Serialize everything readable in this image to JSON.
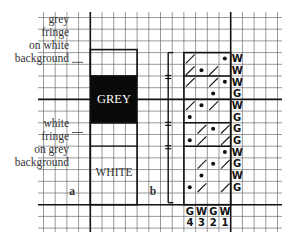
{
  "panel_a": {
    "letter": "a",
    "fringe_label_top": [
      "grey",
      "fringe",
      "on white",
      "background"
    ],
    "fringe_label_bottom": [
      "white",
      "fringe",
      "on grey",
      "background"
    ],
    "grey_block_label": "GREY",
    "white_block_label": "WHITE",
    "colors": {
      "grey_block": "#0a0a0a",
      "grey_text": "#ffffff",
      "white_text": "#333333"
    }
  },
  "panel_b": {
    "letter": "b",
    "row_colors": [
      "W",
      "W",
      "W",
      "G",
      "W",
      "G",
      "G",
      "G",
      "W",
      "G",
      "W",
      "G"
    ],
    "rows": [
      {
        "slashes": [
          1
        ],
        "dots": [
          4
        ]
      },
      {
        "slashes": [
          1,
          3
        ],
        "dots": [
          2
        ]
      },
      {
        "slashes": [
          1,
          3
        ],
        "dots": [
          4
        ]
      },
      {
        "slashes": [],
        "dots": [
          3
        ]
      },
      {
        "slashes": [
          1,
          3
        ],
        "dots": [
          2
        ]
      },
      {
        "slashes": [],
        "dots": [
          1
        ]
      },
      {
        "slashes": [
          2,
          4
        ],
        "dots": [
          3
        ]
      },
      {
        "slashes": [
          2,
          4
        ],
        "dots": [
          1
        ]
      },
      {
        "slashes": [],
        "dots": [
          4
        ]
      },
      {
        "slashes": [
          2,
          4
        ],
        "dots": [
          3
        ]
      },
      {
        "slashes": [],
        "dots": [
          2
        ]
      },
      {
        "slashes": [
          2,
          4
        ],
        "dots": [
          1
        ]
      }
    ],
    "column_colors": [
      "G",
      "W",
      "G",
      "W"
    ],
    "column_numbers": [
      "4",
      "3",
      "2",
      "1"
    ],
    "bracket_marks": [
      "=",
      "±",
      "="
    ]
  },
  "grid": {
    "line_color": "#555555",
    "thick_color": "#111111"
  }
}
